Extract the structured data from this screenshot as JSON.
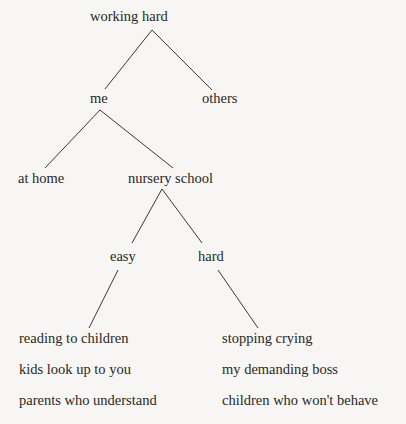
{
  "diagram": {
    "type": "tree",
    "background": "#f7f6f4",
    "ink": "#2a2826",
    "nodes": {
      "root": "working hard",
      "me": "me",
      "others": "others",
      "at_home": "at home",
      "nursery_school": "nursery school",
      "easy": "easy",
      "hard": "hard"
    },
    "easy_items": [
      "reading to children",
      "kids look up to you",
      "parents who understand"
    ],
    "hard_items": [
      "stopping crying",
      "my demanding boss",
      "children who won't behave"
    ],
    "edges": [
      [
        "working hard",
        "me"
      ],
      [
        "working hard",
        "others"
      ],
      [
        "me",
        "at home"
      ],
      [
        "me",
        "nursery school"
      ],
      [
        "nursery school",
        "easy"
      ],
      [
        "nursery school",
        "hard"
      ],
      [
        "easy",
        "reading to children"
      ],
      [
        "hard",
        "stopping crying"
      ]
    ]
  }
}
